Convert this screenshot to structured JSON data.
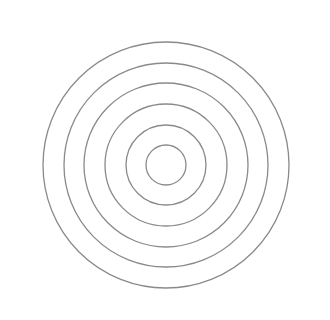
{
  "diagram": {
    "type": "concentric-circles",
    "background": "#ffffff",
    "stroke_color": "#8a8a8a",
    "stroke_width": 1.3,
    "center": {
      "x": 166,
      "y": 165
    },
    "circles": [
      {
        "r": 20
      },
      {
        "r": 40
      },
      {
        "r": 61
      },
      {
        "r": 82
      },
      {
        "r": 102
      },
      {
        "r": 123
      }
    ]
  }
}
